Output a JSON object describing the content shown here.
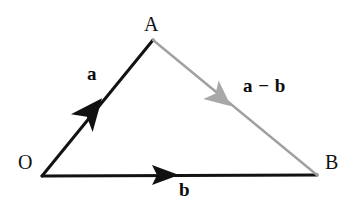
{
  "figure": {
    "background_color": "#ffffff",
    "width": 354,
    "height": 207
  },
  "colors": {
    "stroke_black": "#121212",
    "stroke_gray": "#a0a0a0",
    "arrow_black": "#111111",
    "arrow_gray": "#a8a8a8",
    "text": "#121212"
  },
  "vertices": [
    {
      "name": "O",
      "label": "O",
      "x": 42,
      "y": 176,
      "label_x": 18,
      "label_y": 152
    },
    {
      "name": "A",
      "label": "A",
      "x": 153,
      "y": 40,
      "label_x": 144,
      "label_y": 14
    },
    {
      "name": "B",
      "label": "B",
      "x": 317,
      "y": 175,
      "label_x": 325,
      "label_y": 152
    }
  ],
  "vectors": [
    {
      "name": "vector-a",
      "label": "a",
      "from": "O",
      "to": "A",
      "color": "#121212",
      "stroke_width": 3,
      "arrow_color": "#111111",
      "arrow_at": {
        "x": 90,
        "y": 113
      },
      "label_x": 87,
      "label_y": 64
    },
    {
      "name": "vector-b",
      "label": "b",
      "from": "O",
      "to": "B",
      "color": "#121212",
      "stroke_width": 3,
      "arrow_color": "#111111",
      "arrow_at": {
        "x": 165,
        "y": 175
      },
      "label_x": 179,
      "label_y": 180
    },
    {
      "name": "vector-a-minus-b",
      "label": "a − b",
      "from": "A",
      "to": "B",
      "color": "#a0a0a0",
      "stroke_width": 2,
      "arrow_color": "#a8a8a8",
      "arrow_at": {
        "x": 220,
        "y": 97
      },
      "label_x": 243,
      "label_y": 76
    }
  ]
}
